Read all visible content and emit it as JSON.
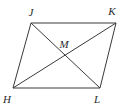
{
  "figure": {
    "name": "parallelogram-jklh",
    "type": "geometry-diagram",
    "shape": "parallelogram",
    "background_color": "#ffffff",
    "stroke_color": "#3a3a3a",
    "label_color": "#2b2b2b",
    "stroke_width": 1,
    "canvas": {
      "width": 129,
      "height": 110
    }
  },
  "vertices": [
    {
      "id": "J",
      "label": "J",
      "x": 31,
      "y": 23,
      "label_x": 31,
      "label_y": 16
    },
    {
      "id": "K",
      "label": "K",
      "x": 116,
      "y": 23,
      "label_x": 112,
      "label_y": 15
    },
    {
      "id": "L",
      "label": "L",
      "x": 100,
      "y": 88,
      "label_x": 97,
      "label_y": 103
    },
    {
      "id": "H",
      "label": "H",
      "x": 13,
      "y": 88,
      "label_x": 7,
      "label_y": 103
    }
  ],
  "intersection": {
    "id": "M",
    "label": "M",
    "x": 65,
    "y": 56,
    "label_x": 64,
    "label_y": 48
  },
  "sides": [
    {
      "name": "JK",
      "from": "J",
      "to": "K"
    },
    {
      "name": "KL",
      "from": "K",
      "to": "L"
    },
    {
      "name": "LH",
      "from": "L",
      "to": "H"
    },
    {
      "name": "HJ",
      "from": "H",
      "to": "J"
    }
  ],
  "diagonals": [
    {
      "name": "JL",
      "from": "J",
      "to": "L"
    },
    {
      "name": "HK",
      "from": "H",
      "to": "K"
    }
  ]
}
